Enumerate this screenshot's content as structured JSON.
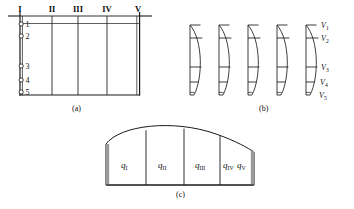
{
  "figure": {
    "panels": [
      "a",
      "b",
      "c"
    ]
  },
  "captions": {
    "a": "(a)",
    "b": "(b)",
    "c": "(c)"
  },
  "panel_a": {
    "description": "Channel cross-section divided by five vertical lines labelled with Roman numerals; five measurement points on the left bank vertical.",
    "verticals": [
      {
        "label": "I",
        "x": 20
      },
      {
        "label": "II",
        "x": 52
      },
      {
        "label": "III",
        "x": 78
      },
      {
        "label": "IV",
        "x": 107
      },
      {
        "label": "V",
        "x": 137
      }
    ],
    "points": [
      {
        "label": "1",
        "y": 24
      },
      {
        "label": "2",
        "y": 36
      },
      {
        "label": "3",
        "y": 66
      },
      {
        "label": "4",
        "y": 80
      },
      {
        "label": "5",
        "y": 92
      }
    ],
    "water_surface_y": 16,
    "bed_y": 95
  },
  "panel_b": {
    "description": "Five vertical velocity-distribution profiles, one per vertical I-V, each split into segments by four horizontal lines.",
    "profile_count": 5,
    "velocity_labels": [
      {
        "label": "V",
        "sub": "1",
        "y": 25
      },
      {
        "label": "V",
        "sub": "2",
        "y": 38
      },
      {
        "label": "V",
        "sub": "3",
        "y": 67
      },
      {
        "label": "V",
        "sub": "4",
        "y": 82
      },
      {
        "label": "V",
        "sub": "5",
        "y": 95
      }
    ]
  },
  "panel_c": {
    "description": "Discharge partition: dome-shaped area divided into four panels by vertical lines, the last panel holding two labels.",
    "cells": [
      {
        "labels": [
          {
            "q": "q",
            "sub": "I"
          }
        ]
      },
      {
        "labels": [
          {
            "q": "q",
            "sub": "II"
          }
        ]
      },
      {
        "labels": [
          {
            "q": "q",
            "sub": "III"
          }
        ]
      },
      {
        "labels": [
          {
            "q": "q",
            "sub": "IV"
          },
          {
            "q": "q",
            "sub": "V"
          }
        ]
      }
    ]
  },
  "colors": {
    "line": "#1a1a1a",
    "shade": "#9a9a9a",
    "background": "#ffffff"
  }
}
